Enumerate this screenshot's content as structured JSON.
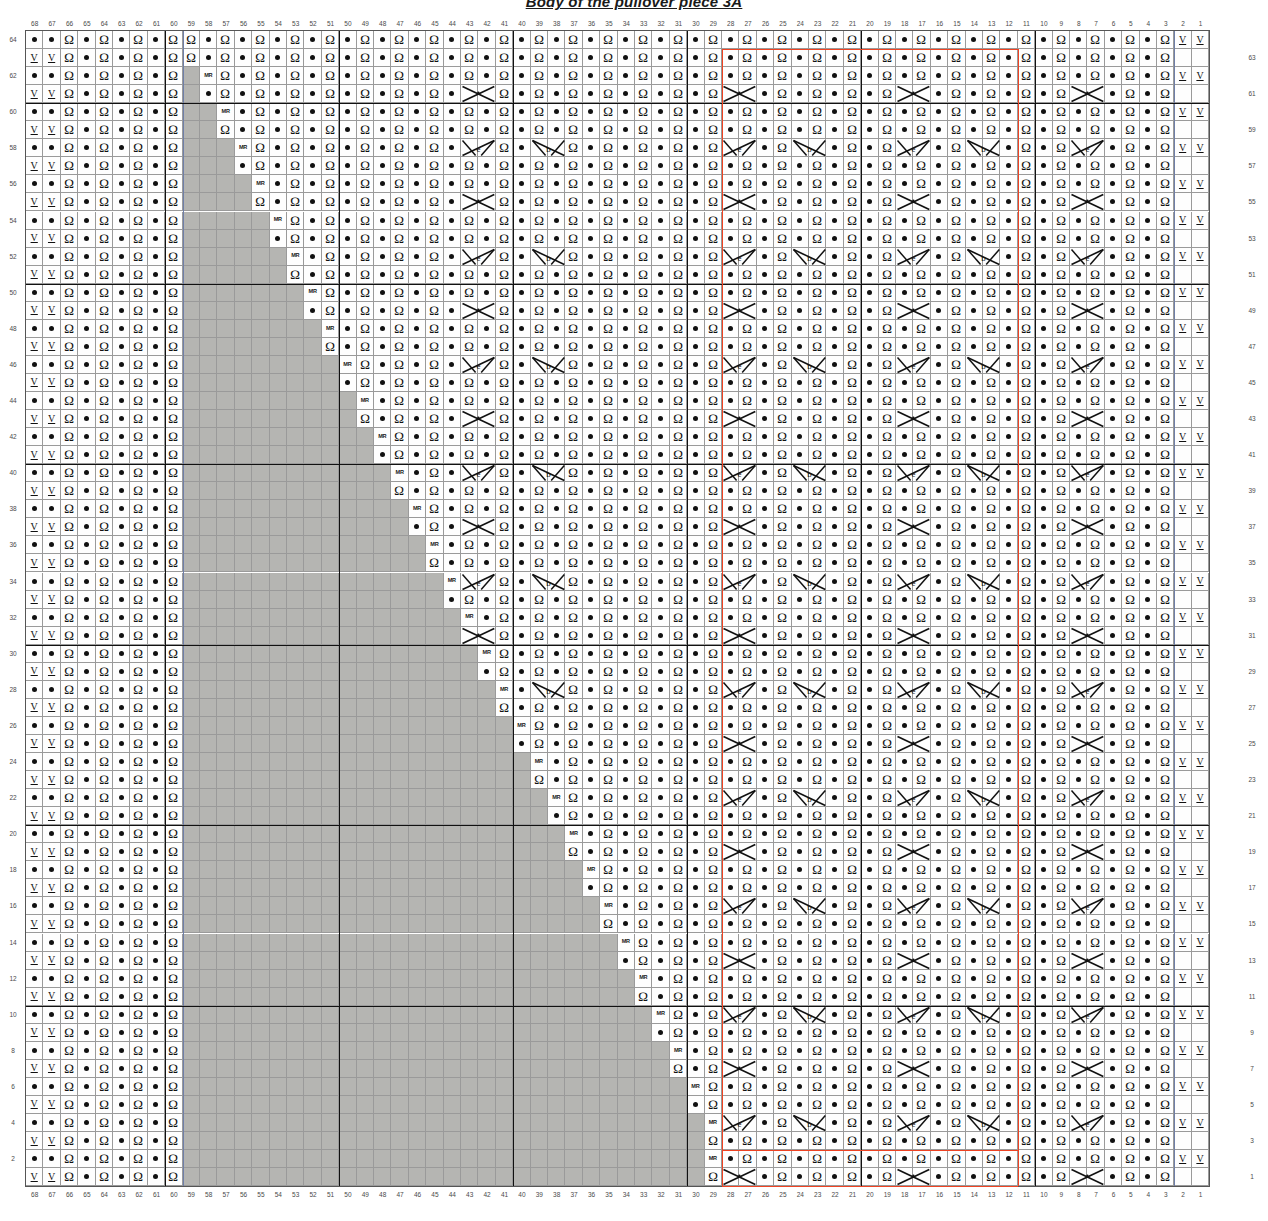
{
  "title": "Body of the pullover piece 3A",
  "chart": {
    "kind": "knitting-stitch-chart",
    "columns": 68,
    "rows": 64,
    "column_numbering": "right-to-left, 1 at far right to 68 at far left",
    "row_numbering": "bottom-to-top, 1 at bottom to 64 at top",
    "col_labels_top": [
      68,
      67,
      66,
      65,
      64,
      63,
      62,
      61,
      60,
      59,
      58,
      57,
      56,
      55,
      54,
      53,
      52,
      51,
      50,
      49,
      48,
      47,
      46,
      45,
      44,
      43,
      42,
      41,
      40,
      39,
      38,
      37,
      36,
      35,
      34,
      33,
      32,
      31,
      30,
      29,
      28,
      27,
      26,
      25,
      24,
      23,
      22,
      21,
      20,
      19,
      18,
      17,
      16,
      15,
      14,
      13,
      12,
      11,
      10,
      9,
      8,
      7,
      6,
      5,
      4,
      3,
      2,
      1
    ],
    "col_labels_bottom": [
      68,
      67,
      66,
      65,
      64,
      63,
      62,
      61,
      60,
      59,
      58,
      57,
      56,
      55,
      54,
      53,
      52,
      51,
      50,
      49,
      48,
      47,
      46,
      45,
      44,
      43,
      42,
      41,
      40,
      39,
      38,
      37,
      36,
      35,
      34,
      33,
      32,
      31,
      30,
      29,
      28,
      27,
      26,
      25,
      24,
      23,
      22,
      21,
      20,
      19,
      18,
      17,
      16,
      15,
      14,
      13,
      12,
      11,
      10,
      9,
      8,
      7,
      6,
      5,
      4,
      3,
      2,
      1
    ],
    "row_labels_left": [
      64,
      62,
      60,
      58,
      56,
      54,
      52,
      50,
      48,
      46,
      44,
      42,
      40,
      38,
      36,
      34,
      32,
      30,
      28,
      26,
      24,
      22,
      20,
      18,
      16,
      14,
      12,
      10,
      8,
      6,
      4,
      2
    ],
    "row_labels_right": [
      63,
      61,
      59,
      57,
      55,
      53,
      51,
      49,
      47,
      45,
      43,
      41,
      39,
      37,
      35,
      33,
      31,
      29,
      27,
      25,
      23,
      21,
      19,
      17,
      15,
      13,
      11,
      9,
      7,
      5,
      3,
      1
    ],
    "heavy_rule_interval": 10,
    "grid": {
      "left": 26,
      "top": 31,
      "cell_w": 17.4,
      "cell_h": 18.05,
      "width": 1183,
      "height": 1155
    },
    "colors": {
      "nostitch_fill": "#b5b5b2",
      "cell_fill": "#fefefe",
      "grid_line": "#9a9a9a",
      "heavy_line": "#111111",
      "repeat_outline": "#ef4323",
      "light_blue_rule": "#6f7fa8",
      "symbol_ink": "#111111"
    },
    "symbols": {
      "dot": {
        "name": "purl-stitch-dot",
        "glyph": "•"
      },
      "q": {
        "name": "knit-through-back-loop-q",
        "glyph": "Ω"
      },
      "v": {
        "name": "slip-stitch-v-underlined",
        "glyph": "V"
      },
      "mr": {
        "name": "make-right-increase",
        "glyph": "MR"
      },
      "x_cable": {
        "name": "cable-cross-x",
        "span": 2
      },
      "twist_left": {
        "name": "twist-left-over-purl",
        "span": 2
      },
      "twist_right": {
        "name": "twist-right-over-purl",
        "span": 2
      },
      "nostitch": {
        "name": "no-stitch-grey",
        "glyph": ""
      }
    },
    "repeat_boxes": [
      {
        "name": "repeat-box-left",
        "col_start": 28,
        "col_end": 27,
        "note": "vertical red rule between col 28 and 27, full height"
      },
      {
        "name": "repeat-box-right",
        "col_start": 12,
        "col_end": 11,
        "note": "vertical red rule between col 12 and 11, full height"
      },
      {
        "name": "repeat-box-bottom",
        "note": "red horizontal segments along rows 1-2 between the two vertical rules"
      }
    ],
    "pattern_notes": {
      "left_edge_columns": "cols 68-60 carry the ribbed border: alternating rows of dot-dot-Q and V-V-Q repeats",
      "staircase": "a grey no-stitch staircase rises from lower-left to upper-left, stepping one column every two rows, with an MR increase marker on each step",
      "body_field": "the main body is a field of purl dots with vertical Q (twisted knit) columns every other stitch",
      "motif_rows": "cable X crossings and paired left/right twists appear on regular motif rows"
    }
  }
}
